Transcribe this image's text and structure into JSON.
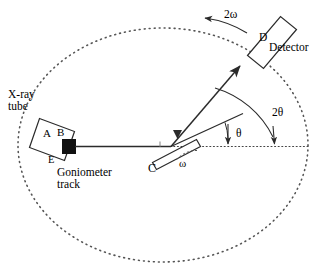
{
  "figure": {
    "type": "schematic-diagram",
    "background_color": "#ffffff",
    "line_color": "#2b2b2b",
    "dotted_color": "#555555",
    "focal_spot_color": "#111111"
  },
  "labels": {
    "xray_tube": "X-ray\ntube",
    "point_a": "A",
    "point_b": "B",
    "point_e": "E",
    "goniometer_track": "Goniometer\ntrack",
    "sample_c": "C",
    "omega": "ω",
    "theta": "θ",
    "two_theta": "2θ",
    "two_omega": "2ω",
    "detector_d": "D",
    "detector": "Detector"
  },
  "geometry": {
    "track_center_x": 163,
    "track_center_y": 145,
    "track_radius_x": 145,
    "track_radius_y": 117,
    "sample_center_x": 172,
    "sample_center_y": 146,
    "focal_spot_x": 69,
    "focal_spot_y": 146,
    "detector_center_x": 268,
    "detector_center_y": 38
  },
  "annotations": {
    "incident_beam": "horizontal solid beam from focal spot B to sample C",
    "diffracted_beam": "solid beam from sample C up-right to detector D with arrowhead",
    "reference_axis": "dotted horizontal axis through sample to right edge",
    "theta_arc": "small arc from sample surface down to horizontal reference",
    "two_theta_arc": "large arc from diffracted beam down to horizontal reference",
    "two_omega_arc": "arrowed arc along goniometer track pointing counter-clockwise",
    "omega_arc": "dashed arc at sample showing tilt angle omega"
  }
}
